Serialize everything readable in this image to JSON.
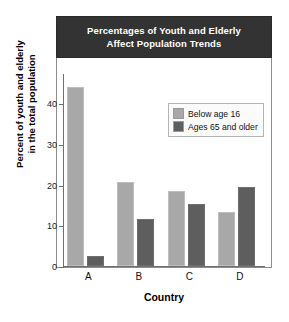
{
  "chart_data": {
    "type": "bar",
    "title": "Percentages of Youth and Elderly Affect Population Trends",
    "title_line1": "Percentages of Youth and Elderly",
    "title_line2": "Affect Population Trends",
    "xlabel": "Country",
    "ylabel": "Percent of youth and elderly in the total population",
    "ylabel_line1": "Percent of youth and elderly",
    "ylabel_line2": "in the total population",
    "categories": [
      "A",
      "B",
      "C",
      "D"
    ],
    "yticks": [
      0,
      10,
      20,
      30,
      40
    ],
    "ytick_labels": [
      "0",
      "10",
      "20",
      "30",
      "40"
    ],
    "ylim": [
      0,
      47
    ],
    "grid": false,
    "legend_position": "upper right",
    "series": [
      {
        "name": "Below age 16",
        "color": "#a8a8a8",
        "values": [
          44,
          20.7,
          18.5,
          13.3
        ]
      },
      {
        "name": "Ages 65 and older",
        "color": "#5e5e5e",
        "values": [
          2.5,
          11.5,
          15.2,
          19.4
        ]
      }
    ]
  },
  "colors": {
    "title_banner_bg": "#333333",
    "title_text": "#ffffff",
    "frame_border": "#8d8d8d",
    "axis": "#6f6f6f",
    "below_age_16": "#a8a8a8",
    "ages_65_and_older": "#5e5e5e",
    "background": "#ffffff"
  }
}
